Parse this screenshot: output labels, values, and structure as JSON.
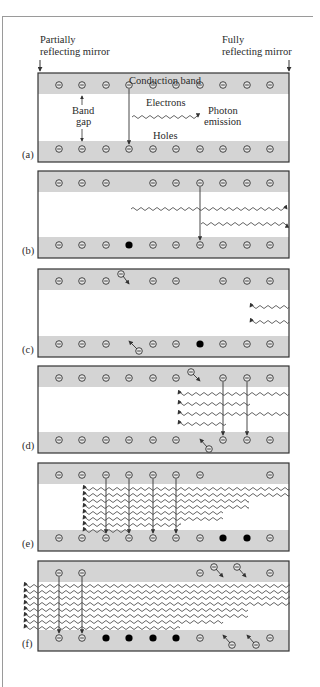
{
  "header": {
    "left_mirror": [
      "Partially",
      "reflecting mirror"
    ],
    "right_mirror": [
      "Fully",
      "reflecting mirror"
    ]
  },
  "labels": {
    "conduction_band": "Conduction band",
    "band_gap": [
      "Band",
      "gap"
    ],
    "electrons": "Electrons",
    "photon_emission": [
      "Photon",
      "emission"
    ],
    "holes": "Holes"
  },
  "colors": {
    "band_gray": "#d4d4d4",
    "border": "#333333",
    "wave": "#555555",
    "hole_fill": "#000000"
  },
  "layout": {
    "box_left": 38,
    "box_right": 289,
    "columns_x": [
      59,
      82,
      106,
      129,
      153,
      176,
      200,
      223,
      247,
      270
    ]
  },
  "panels": [
    {
      "label": "(a)",
      "top": 73,
      "bottom": 162,
      "conduction": [
        1,
        1,
        1,
        1,
        1,
        1,
        1,
        1,
        1,
        1
      ],
      "valence": [
        "e",
        "e",
        "e",
        "e",
        "e",
        "e",
        "e",
        "e",
        "e",
        "e"
      ],
      "transitions": [
        3
      ],
      "waves": [
        {
          "y": 117,
          "x1": 132,
          "x2": 198,
          "dir": "right"
        }
      ],
      "escaped_up": [],
      "escaped_down": []
    },
    {
      "label": "(b)",
      "top": 171,
      "bottom": 258,
      "conduction": [
        1,
        1,
        1,
        0,
        1,
        1,
        1,
        1,
        1,
        1
      ],
      "valence": [
        "e",
        "e",
        "e",
        "h",
        "e",
        "e",
        "e",
        "e",
        "e",
        "e"
      ],
      "transitions": [
        6
      ],
      "waves": [
        {
          "y": 209,
          "x1": 131,
          "x2": 287,
          "dir": "right"
        },
        {
          "y": 224,
          "x1": 201,
          "x2": 287,
          "dir": "right"
        }
      ],
      "escaped_up": [],
      "escaped_down": []
    },
    {
      "label": "(c)",
      "top": 269,
      "bottom": 357,
      "conduction": [
        1,
        1,
        1,
        0,
        1,
        1,
        0,
        1,
        1,
        1
      ],
      "valence": [
        "e",
        "e",
        "e",
        "0",
        "e",
        "e",
        "h",
        "e",
        "e",
        "e"
      ],
      "transitions": [],
      "waves": [
        {
          "y": 307,
          "x1": 250,
          "x2": 289,
          "dir": "left"
        },
        {
          "y": 322,
          "x1": 250,
          "x2": 289,
          "dir": "left"
        }
      ],
      "escaped_up": [
        {
          "x": 121,
          "y": 274,
          "tx": 129,
          "ty": 284
        }
      ],
      "escaped_down": [
        {
          "x": 139,
          "y": 351,
          "tx": 129,
          "ty": 341
        }
      ]
    },
    {
      "label": "(d)",
      "top": 366,
      "bottom": 453,
      "conduction": [
        1,
        1,
        1,
        1,
        1,
        1,
        0,
        1,
        1,
        1
      ],
      "valence": [
        "e",
        "e",
        "e",
        "e",
        "e",
        "e",
        "0",
        "e",
        "e",
        "e"
      ],
      "transitions": [
        7,
        8
      ],
      "waves": [
        {
          "y": 394,
          "x1": 178,
          "x2": 289,
          "dir": "left"
        },
        {
          "y": 404,
          "x1": 178,
          "x2": 250,
          "dir": "left"
        },
        {
          "y": 414,
          "x1": 178,
          "x2": 289,
          "dir": "left"
        },
        {
          "y": 424,
          "x1": 178,
          "x2": 226,
          "dir": "left"
        }
      ],
      "escaped_up": [
        {
          "x": 191,
          "y": 372,
          "tx": 200,
          "ty": 381
        }
      ],
      "escaped_down": [
        {
          "x": 209,
          "y": 449,
          "tx": 200,
          "ty": 439
        }
      ]
    },
    {
      "label": "(e)",
      "top": 463,
      "bottom": 551,
      "conduction": [
        1,
        1,
        1,
        1,
        1,
        1,
        1,
        0,
        0,
        1
      ],
      "valence": [
        "e",
        "e",
        "e",
        "e",
        "e",
        "e",
        "e",
        "h",
        "h",
        "e"
      ],
      "transitions": [
        2,
        3,
        4,
        5
      ],
      "waves": [
        {
          "y": 489,
          "x1": 83,
          "x2": 289,
          "dir": "left"
        },
        {
          "y": 495,
          "x1": 83,
          "x2": 289,
          "dir": "left"
        },
        {
          "y": 501,
          "x1": 83,
          "x2": 248,
          "dir": "left"
        },
        {
          "y": 507,
          "x1": 83,
          "x2": 248,
          "dir": "left"
        },
        {
          "y": 513,
          "x1": 83,
          "x2": 223,
          "dir": "left"
        },
        {
          "y": 519,
          "x1": 83,
          "x2": 223,
          "dir": "left"
        },
        {
          "y": 525,
          "x1": 83,
          "x2": 180,
          "dir": "left"
        },
        {
          "y": 531,
          "x1": 83,
          "x2": 130,
          "dir": "left"
        }
      ],
      "escaped_up": [],
      "escaped_down": []
    },
    {
      "label": "(f)",
      "top": 561,
      "bottom": 651,
      "conduction": [
        1,
        1,
        0,
        0,
        0,
        0,
        1,
        0,
        0,
        1
      ],
      "valence": [
        "e",
        "e",
        "h",
        "h",
        "h",
        "h",
        "e",
        "0",
        "0",
        "e"
      ],
      "transitions": [
        0,
        1
      ],
      "waves": [
        {
          "y": 586,
          "x1": 24,
          "x2": 289,
          "dir": "left"
        },
        {
          "y": 592,
          "x1": 24,
          "x2": 289,
          "dir": "left"
        },
        {
          "y": 598,
          "x1": 24,
          "x2": 289,
          "dir": "left"
        },
        {
          "y": 604,
          "x1": 24,
          "x2": 289,
          "dir": "left"
        },
        {
          "y": 610,
          "x1": 24,
          "x2": 248,
          "dir": "left"
        },
        {
          "y": 616,
          "x1": 24,
          "x2": 248,
          "dir": "left"
        },
        {
          "y": 622,
          "x1": 24,
          "x2": 223,
          "dir": "left"
        },
        {
          "y": 628,
          "x1": 24,
          "x2": 180,
          "dir": "left"
        }
      ],
      "escaped_up": [
        {
          "x": 214,
          "y": 567,
          "tx": 223,
          "ty": 577
        },
        {
          "x": 237,
          "y": 567,
          "tx": 246,
          "ty": 577
        }
      ],
      "escaped_down": [
        {
          "x": 232,
          "y": 645,
          "tx": 223,
          "ty": 635
        },
        {
          "x": 256,
          "y": 645,
          "tx": 247,
          "ty": 635
        }
      ]
    }
  ]
}
